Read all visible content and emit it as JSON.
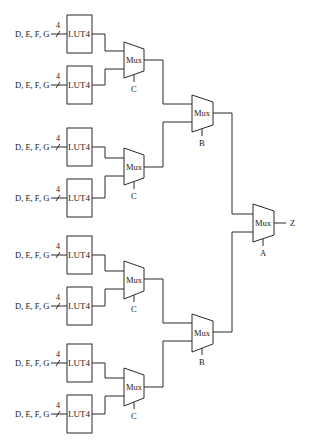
{
  "diagram": {
    "type": "mux-tree",
    "colors": {
      "line": "#2a2a2a",
      "text": "#1a1a1a",
      "background": "#ffffff"
    },
    "luts": [
      {
        "id": "lut1",
        "input_label": "D, E, F, G",
        "bus_width": "4",
        "label": "LUT4"
      },
      {
        "id": "lut2",
        "input_label": "D, E, F, G",
        "bus_width": "4",
        "label": "LUT4"
      },
      {
        "id": "lut3",
        "input_label": "D, E, F, G",
        "bus_width": "4",
        "label": "LUT4"
      },
      {
        "id": "lut4",
        "input_label": "D, E, F, G",
        "bus_width": "4",
        "label": "LUT4"
      },
      {
        "id": "lut5",
        "input_label": "D, E, F, G",
        "bus_width": "4",
        "label": "LUT4"
      },
      {
        "id": "lut6",
        "input_label": "D, E, F, G",
        "bus_width": "4",
        "label": "LUT4"
      },
      {
        "id": "lut7",
        "input_label": "D, E, F, G",
        "bus_width": "4",
        "label": "LUT4"
      },
      {
        "id": "lut8",
        "input_label": "D, E, F, G",
        "bus_width": "4",
        "label": "LUT4"
      }
    ],
    "muxes_level1": [
      {
        "id": "mux-c1",
        "label": "Mux",
        "select": "C"
      },
      {
        "id": "mux-c2",
        "label": "Mux",
        "select": "C"
      },
      {
        "id": "mux-c3",
        "label": "Mux",
        "select": "C"
      },
      {
        "id": "mux-c4",
        "label": "Mux",
        "select": "C"
      }
    ],
    "muxes_level2": [
      {
        "id": "mux-b1",
        "label": "Mux",
        "select": "B"
      },
      {
        "id": "mux-b2",
        "label": "Mux",
        "select": "B"
      }
    ],
    "mux_level3": {
      "id": "mux-a",
      "label": "Mux",
      "select": "A"
    },
    "output": {
      "label": "Z"
    }
  }
}
